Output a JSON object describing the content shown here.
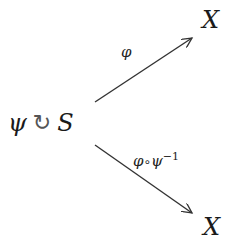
{
  "diagram": {
    "type": "commutative-diagram",
    "source": {
      "group": "ψ",
      "action_symbol": "↻",
      "set": "S"
    },
    "targets": {
      "top": "X",
      "bottom": "X"
    },
    "edges": [
      {
        "from": "S",
        "to": "X (top)",
        "label": "φ"
      },
      {
        "from": "S",
        "to": "X (bottom)",
        "label_main": "φ",
        "label_compose": "∘",
        "label_inner": "ψ",
        "label_exponent": "−1"
      }
    ],
    "colors": {
      "stroke": "#333333",
      "text": "#1a1a1a",
      "background": "#ffffff"
    }
  }
}
